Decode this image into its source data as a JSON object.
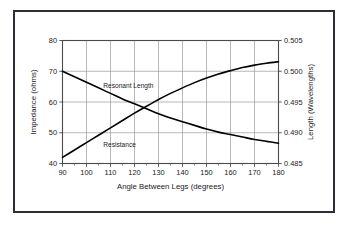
{
  "chart_data": {
    "type": "line",
    "title": "",
    "subtitle": "",
    "xlabel": "Angle Between Legs (degrees)",
    "ylabel": "Impedance (ohms)",
    "y2label": "Length (Wavelengths)",
    "xlim": [
      90,
      180
    ],
    "ylim": [
      40,
      80
    ],
    "y2lim": [
      0.485,
      0.505
    ],
    "xticks": [
      90,
      100,
      110,
      120,
      130,
      140,
      150,
      160,
      170,
      180
    ],
    "xticklabels": [
      "90",
      "100",
      "110",
      "120",
      "130",
      "140",
      "150",
      "160",
      "170",
      "180"
    ],
    "yticks": [
      40,
      50,
      60,
      70,
      80
    ],
    "yticklabels": [
      "40",
      "50",
      "60",
      "70",
      "80"
    ],
    "y2ticks": [
      0.485,
      0.49,
      0.495,
      0.5,
      0.505
    ],
    "y2ticklabels": [
      "0.485",
      "0.490",
      "0.495",
      "0.500",
      "0.505"
    ],
    "grid": true,
    "minor_xticks": [
      95,
      105,
      115,
      125,
      135,
      145,
      155,
      165,
      175
    ],
    "legend_position": "inline-annotations",
    "line_color": "#000000",
    "grid_color": "#9a9a9a",
    "axis_color": "#4a4a4a",
    "frame_color": "#2b2f33",
    "series": [
      {
        "name": "Resonant Length",
        "axis": "right",
        "annotation": "Resonant Length",
        "annotation_x": 107,
        "annotation_y_value": 0.4973,
        "x": [
          90,
          95,
          100,
          105,
          110,
          115,
          120,
          125,
          130,
          135,
          140,
          145,
          150,
          155,
          160,
          165,
          170,
          175,
          180
        ],
        "y": [
          0.5,
          0.4991,
          0.4982,
          0.4973,
          0.4964,
          0.4955,
          0.4947,
          0.4939,
          0.4931,
          0.4924,
          0.4918,
          0.4912,
          0.4906,
          0.4901,
          0.4897,
          0.4893,
          0.4889,
          0.4886,
          0.4883
        ],
        "y_impedance_equiv": [
          70.0,
          68.2,
          66.4,
          64.6,
          62.8,
          61.0,
          59.4,
          57.8,
          56.2,
          54.8,
          53.6,
          52.4,
          51.2,
          50.2,
          49.4,
          48.6,
          47.8,
          47.2,
          46.6
        ]
      },
      {
        "name": "Resistance",
        "axis": "left",
        "annotation": "Resistance",
        "annotation_x": 107,
        "annotation_y_value": 45.5,
        "x": [
          90,
          95,
          100,
          105,
          110,
          115,
          120,
          125,
          130,
          135,
          140,
          145,
          150,
          155,
          160,
          165,
          170,
          175,
          180
        ],
        "y": [
          42.0,
          44.4,
          46.8,
          49.2,
          51.6,
          54.0,
          56.4,
          58.6,
          60.8,
          62.8,
          64.6,
          66.3,
          67.8,
          69.1,
          70.2,
          71.2,
          72.0,
          72.6,
          73.1
        ]
      }
    ]
  },
  "figure": {
    "background_color": "#ffffff",
    "border_color": "#2b2f33"
  }
}
